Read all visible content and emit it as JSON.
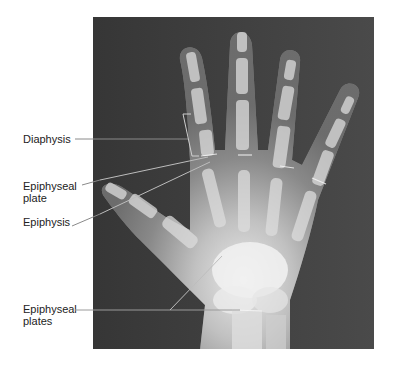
{
  "figure": {
    "labels": [
      {
        "id": "diaphysis",
        "text": "Diaphysis"
      },
      {
        "id": "epiphyseal-plate",
        "text": "Epiphyseal\nplate",
        "line1": "Epiphyseal",
        "line2": "plate"
      },
      {
        "id": "epiphysis",
        "text": "Epiphysis"
      },
      {
        "id": "epiphyseal-plates",
        "text": "Epiphyseal\nplates",
        "line1": "Epiphyseal",
        "line2": "plates"
      }
    ]
  },
  "colors": {
    "background": "#ffffff",
    "xray_dark": "#3a3a3a",
    "bone": "#e8e8e8",
    "leader_line": "#888888",
    "text": "#222222"
  }
}
